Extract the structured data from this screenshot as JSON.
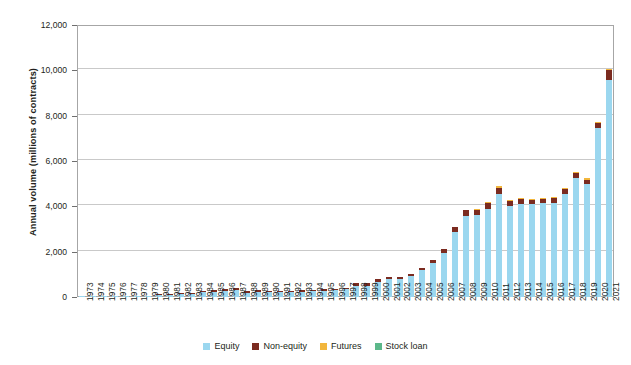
{
  "chart_data": {
    "type": "bar",
    "subtype": "stacked",
    "title": "",
    "xlabel": "",
    "ylabel": "Annual volume (millions of contracts)",
    "ylim": [
      0,
      12000
    ],
    "ytick_values": [
      0,
      2000,
      4000,
      6000,
      8000,
      10000,
      12000
    ],
    "ytick_labels": [
      "0",
      "2,000",
      "4,000",
      "6,000",
      "8,000",
      "10,000",
      "12,000"
    ],
    "grid": true,
    "grid_axis": "y",
    "legend_position": "bottom",
    "categories": [
      "1973",
      "1974",
      "1975",
      "1976",
      "1977",
      "1978",
      "1979",
      "1980",
      "1981",
      "1982",
      "1983",
      "1984",
      "1985",
      "1986",
      "1987",
      "1988",
      "1989",
      "1990",
      "1991",
      "1992",
      "1993",
      "1994",
      "1995",
      "1996",
      "1997",
      "1998",
      "1999",
      "2000",
      "2001",
      "2002",
      "2003",
      "2004",
      "2005",
      "2006",
      "2007",
      "2008",
      "2009",
      "2010",
      "2011",
      "2012",
      "2013",
      "2014",
      "2015",
      "2016",
      "2017",
      "2018",
      "2019",
      "2020",
      "2021"
    ],
    "series": [
      {
        "name": "Equity",
        "color": "#9bd7ef",
        "values": [
          1,
          5,
          18,
          32,
          39,
          57,
          65,
          97,
          110,
          137,
          149,
          238,
          227,
          277,
          305,
          197,
          227,
          210,
          201,
          202,
          237,
          255,
          287,
          293,
          338,
          508,
          507,
          673,
          780,
          779,
          908,
          1185,
          1504,
          1963,
          2864,
          3584,
          3611,
          3899,
          4562,
          4002,
          4111,
          4084,
          4139,
          4167,
          4555,
          5245,
          4965,
          7470,
          9575
        ]
      },
      {
        "name": "Non-equity",
        "color": "#7b2b20",
        "values": [
          0,
          0,
          0,
          0,
          0,
          0,
          0,
          3,
          5,
          8,
          12,
          47,
          64,
          76,
          91,
          63,
          65,
          68,
          62,
          61,
          63,
          71,
          72,
          76,
          82,
          91,
          93,
          104,
          107,
          102,
          99,
          116,
          140,
          167,
          224,
          266,
          219,
          237,
          261,
          218,
          213,
          198,
          191,
          182,
          192,
          230,
          206,
          213,
          430
        ]
      },
      {
        "name": "Futures",
        "color": "#f2b63c",
        "values": [
          0,
          0,
          0,
          0,
          0,
          0,
          0,
          0,
          0,
          0,
          0,
          0,
          0,
          0,
          0,
          0,
          0,
          0,
          0,
          0,
          0,
          0,
          0,
          0,
          0,
          0,
          0,
          0,
          0,
          0,
          0,
          0,
          0,
          0,
          0,
          0,
          27,
          48,
          67,
          56,
          54,
          51,
          48,
          45,
          54,
          63,
          60,
          60,
          75
        ]
      },
      {
        "name": "Stock loan",
        "color": "#5cb88a",
        "values": [
          0,
          0,
          0,
          0,
          0,
          0,
          0,
          0,
          0,
          0,
          0,
          0,
          0,
          0,
          0,
          0,
          0,
          0,
          0,
          0,
          0,
          0,
          0,
          0,
          0,
          0,
          0,
          0,
          0,
          0,
          0,
          0,
          0,
          0,
          0,
          0,
          0,
          0,
          0,
          0,
          0,
          0,
          0,
          0,
          0,
          0,
          0,
          0,
          0
        ]
      }
    ],
    "legend": [
      {
        "label": "Equity",
        "color": "#9bd7ef"
      },
      {
        "label": "Non-equity",
        "color": "#7b2b20"
      },
      {
        "label": "Futures",
        "color": "#f2b63c"
      },
      {
        "label": "Stock loan",
        "color": "#5cb88a"
      }
    ]
  }
}
